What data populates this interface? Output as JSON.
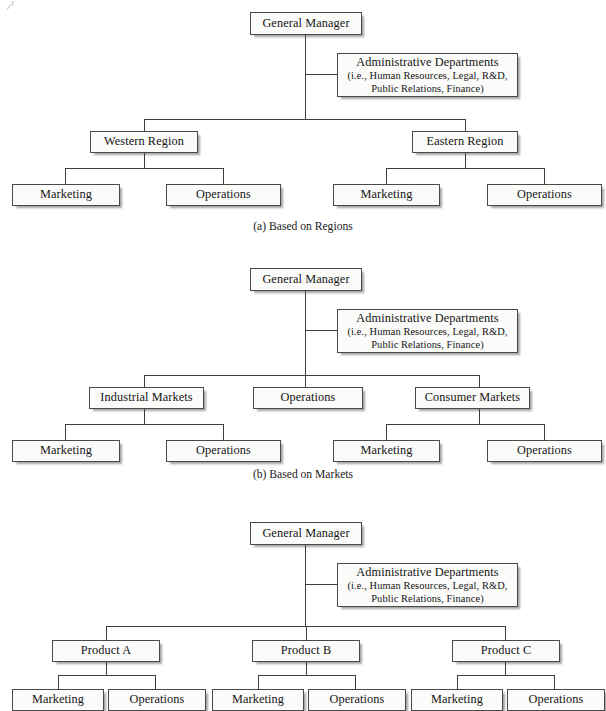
{
  "page": {
    "background_color": "#ffffff",
    "box_fill_color": "#fbfbfa",
    "box_border_color": "#4a4a4a",
    "line_color": "#3d3d3d",
    "text_color": "#151515"
  },
  "shared": {
    "general_manager": "General Manager",
    "admin_title": "Administrative Departments",
    "admin_line2": "(i.e., Human Resources, Legal, R&D,",
    "admin_line3": "Public Relations, Finance)",
    "marketing": "Marketing",
    "operations": "Operations"
  },
  "charts": [
    {
      "id": "a",
      "caption": "(a) Based on Regions",
      "root": "General Manager",
      "staff": {
        "title": "Administrative Departments",
        "line2": "(i.e., Human Resources, Legal, R&D,",
        "line3": "Public Relations, Finance)"
      },
      "divisions": [
        {
          "label": "Western Region",
          "children": [
            "Marketing",
            "Operations"
          ]
        },
        {
          "label": "Eastern Region",
          "children": [
            "Marketing",
            "Operations"
          ]
        }
      ]
    },
    {
      "id": "b",
      "caption": "(b) Based on Markets",
      "root": "General Manager",
      "staff": {
        "title": "Administrative Departments",
        "line2": "(i.e., Human Resources, Legal, R&D,",
        "line3": "Public Relations, Finance)"
      },
      "divisions": [
        {
          "label": "Industrial Markets",
          "children": [
            "Marketing",
            "Operations"
          ]
        },
        {
          "label": "Operations",
          "children": []
        },
        {
          "label": "Consumer Markets",
          "children": [
            "Marketing",
            "Operations"
          ]
        }
      ]
    },
    {
      "id": "c",
      "caption": "",
      "root": "General Manager",
      "staff": {
        "title": "Administrative Departments",
        "line2": "(i.e., Human Resources, Legal, R&D,",
        "line3": "Public Relations, Finance)"
      },
      "divisions": [
        {
          "label": "Product A",
          "children": [
            "Marketing",
            "Operations"
          ]
        },
        {
          "label": "Product B",
          "children": [
            "Marketing",
            "Operations"
          ]
        },
        {
          "label": "Product C",
          "children": [
            "Marketing",
            "Operations"
          ]
        }
      ]
    }
  ]
}
